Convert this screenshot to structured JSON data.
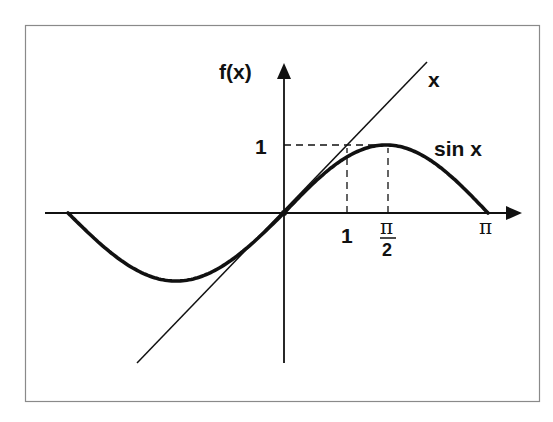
{
  "figure": {
    "frame_color": "#8a8a8a",
    "ink_color": "#111111",
    "y_axis_label": "f(x)",
    "line_label": "x",
    "curve_label": "sin x",
    "y_tick_label": "1",
    "x_tick_labels": {
      "one": "1",
      "half_pi_num": "π",
      "half_pi_den": "2",
      "pi": "π"
    }
  },
  "chart_data": {
    "type": "line",
    "title": "",
    "xlabel": "",
    "ylabel": "f(x)",
    "series": [
      {
        "name": "sin x",
        "function": "sin(x)",
        "x_range": [
          -3.1416,
          3.1416
        ],
        "style": "thick"
      },
      {
        "name": "x",
        "function": "x",
        "x_range": [
          -2.3,
          2.3
        ],
        "style": "thin"
      }
    ],
    "x_ticks": [
      {
        "value": 1,
        "label": "1"
      },
      {
        "value": 1.5708,
        "label": "π/2"
      },
      {
        "value": 3.1416,
        "label": "π"
      }
    ],
    "y_ticks": [
      {
        "value": 1,
        "label": "1"
      }
    ],
    "guides": [
      {
        "type": "dashed",
        "from": [
          0,
          1
        ],
        "to": [
          1.5708,
          1
        ]
      },
      {
        "type": "dashed",
        "from": [
          1,
          0
        ],
        "to": [
          1,
          1
        ]
      },
      {
        "type": "dashed",
        "from": [
          1.5708,
          0
        ],
        "to": [
          1.5708,
          1
        ]
      }
    ],
    "grid": false,
    "legend": "inline labels"
  }
}
